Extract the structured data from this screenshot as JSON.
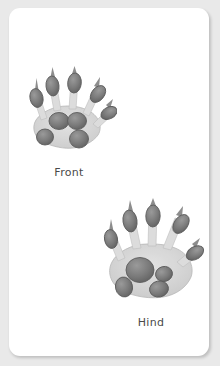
{
  "card": {
    "background_color": "#ffffff",
    "page_background_color": "#e9e9e9"
  },
  "figures": [
    {
      "id": "front-paw",
      "caption": "Front",
      "icon_name": "front-paw-print-illustration",
      "toe_count": 5,
      "claw_count": 5,
      "palm_pad_count": 4
    },
    {
      "id": "hind-paw",
      "caption": "Hind",
      "icon_name": "hind-paw-print-illustration",
      "toe_count": 5,
      "claw_count": 5,
      "palm_pad_count": 4
    }
  ],
  "colors": {
    "pad_fill": "#7d7d7d",
    "pad_stroke": "#5a5a5a",
    "sole_fill": "#d8d8d8",
    "sole_stroke": "#b0b0b0",
    "claw": "#8a8a8a",
    "caption_text": "#4a4a4a"
  }
}
